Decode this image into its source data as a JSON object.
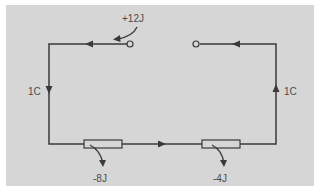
{
  "diagram": {
    "type": "circuit",
    "colors": {
      "background": "#d6d6d6",
      "wire": "#3a3a3a",
      "text": "#4a4a4a",
      "page": "#ffffff"
    },
    "source": {
      "label": "+12J",
      "terminals": [
        "left-terminal",
        "right-terminal"
      ]
    },
    "charge_labels": {
      "left": "1C",
      "right": "1C"
    },
    "resistors": [
      {
        "id": "R1",
        "label": "-8J"
      },
      {
        "id": "R2",
        "label": "-4J"
      }
    ]
  }
}
